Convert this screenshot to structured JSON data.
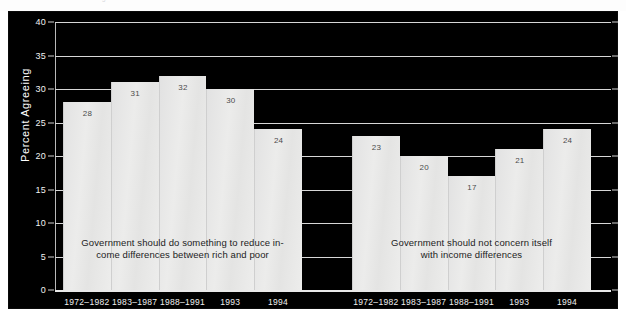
{
  "figure": {
    "ghost_caption": "Figure 1   Attitudes toward income differences",
    "background_color": "#000000",
    "bar_color": "#e9e9e8",
    "text_color": "#ffffff"
  },
  "chart_data": {
    "type": "bar",
    "title": "",
    "xlabel": "",
    "ylabel": "Percent Agreeing",
    "ylim": [
      0,
      40
    ],
    "ytick_values": [
      0,
      5,
      10,
      15,
      20,
      25,
      30,
      35,
      40
    ],
    "ytick_labels": [
      "0",
      "5",
      "10",
      "15",
      "20",
      "25",
      "30",
      "35",
      "40"
    ],
    "grid": true,
    "legend_position": "none",
    "categories": [
      "1972–1982",
      "1983–1987",
      "1988–1991",
      "1993",
      "1994"
    ],
    "series": [
      {
        "name": "Government should do something to reduce income differences between rich and poor",
        "values": [
          28,
          31,
          32,
          30,
          24
        ]
      },
      {
        "name": "Government should not concern itself with income differences",
        "values": [
          23,
          20,
          17,
          21,
          24
        ]
      }
    ],
    "annotations": [
      {
        "id": "left-group-annotation",
        "line1": "Government should do something to reduce in-",
        "line2": "come differences between rich and poor"
      },
      {
        "id": "right-group-annotation",
        "line1": "Government should not concern itself",
        "line2": "with income differences"
      }
    ]
  }
}
